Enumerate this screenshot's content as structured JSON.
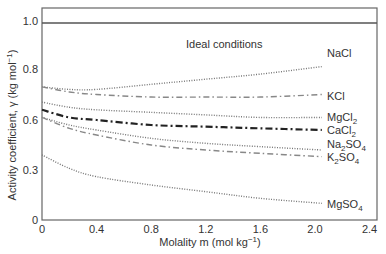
{
  "chart_data": {
    "type": "line",
    "title": "",
    "xlabel": "Molality m (mol kg⁻¹)",
    "ylabel": "Activity coefficient, γ (kg mol⁻¹)",
    "xlim": [
      0,
      2.5
    ],
    "ylim": [
      0,
      1.05
    ],
    "grid": false,
    "legend_position": "inline-right",
    "x_ticks": [
      {
        "value": 0,
        "label": "0"
      },
      {
        "value": 0.4,
        "label": "0.4"
      },
      {
        "value": 0.8,
        "label": "0.8"
      },
      {
        "value": 1.2,
        "label": "1.2"
      },
      {
        "value": 1.6,
        "label": "1.6"
      },
      {
        "value": 2.0,
        "label": "2.0"
      },
      {
        "value": 2.4,
        "label": "2.4"
      }
    ],
    "y_ticks": [
      {
        "value": 0,
        "label": "0"
      },
      {
        "value": 0.3,
        "label": "0.3"
      },
      {
        "value": 0.6,
        "label": "0.6"
      },
      {
        "value": 0.8,
        "label": "0.8"
      },
      {
        "value": 1.0,
        "label": "1.0"
      }
    ],
    "annotations": [
      {
        "text": "Ideal conditions",
        "x": 1.2,
        "y": 0.94
      }
    ],
    "x": [
      0,
      0.2,
      0.4,
      0.8,
      1.2,
      1.6,
      2.05
    ],
    "series": [
      {
        "name": "Ideal",
        "label": "",
        "style": "solid",
        "color": "#555555",
        "x": [
          0,
          2.5
        ],
        "values": [
          0.99,
          0.99
        ]
      },
      {
        "name": "NaCl",
        "label": "NaCl",
        "style": "dotted",
        "color": "#777777",
        "values": [
          0.73,
          0.72,
          0.72,
          0.74,
          0.76,
          0.78,
          0.81
        ]
      },
      {
        "name": "KCl",
        "label": "KCl",
        "style": "dashdot",
        "color": "#888888",
        "values": [
          0.73,
          0.71,
          0.7,
          0.69,
          0.69,
          0.69,
          0.7
        ]
      },
      {
        "name": "MgCl2",
        "label": "MgCl₂",
        "style": "dotted",
        "color": "#777777",
        "values": [
          0.67,
          0.65,
          0.64,
          0.63,
          0.62,
          0.61,
          0.61
        ]
      },
      {
        "name": "CaCl2",
        "label": "CaCl₂",
        "style": "dashdot-bold",
        "color": "#222222",
        "values": [
          0.64,
          0.61,
          0.6,
          0.57,
          0.56,
          0.55,
          0.54
        ]
      },
      {
        "name": "Na2SO4",
        "label": "Na₂SO₄",
        "style": "dotted",
        "color": "#777777",
        "values": [
          0.61,
          0.57,
          0.54,
          0.49,
          0.46,
          0.44,
          0.42
        ]
      },
      {
        "name": "K2SO4",
        "label": "K₂SO₄",
        "style": "dashdot",
        "color": "#888888",
        "values": [
          0.61,
          0.55,
          0.51,
          0.45,
          0.42,
          0.4,
          0.38
        ]
      },
      {
        "name": "MgSO4",
        "label": "MgSO₄",
        "style": "dotted",
        "color": "#777777",
        "values": [
          0.39,
          0.31,
          0.26,
          0.21,
          0.17,
          0.13,
          0.1
        ]
      }
    ]
  },
  "labels": {
    "ideal": "Ideal conditions",
    "xlabel": "Molality m (mol kg",
    "xlabel_sup": "−1",
    "xlabel_end": ")",
    "ylabel": "Activity coefficient, γ (kg mol",
    "ylabel_sup": "−1",
    "ylabel_end": ")",
    "nacl": "NaCl",
    "kcl": "KCl",
    "mgcl_a": "MgCl",
    "mgcl_sub": "2",
    "cacl_a": "CaCl",
    "cacl_sub": "2",
    "na2so4_a": "Na",
    "na2so4_sub1": "2",
    "na2so4_b": "SO",
    "na2so4_sub2": "4",
    "k2so4_a": "K",
    "k2so4_sub1": "2",
    "k2so4_b": "SO",
    "k2so4_sub2": "4",
    "mgso4_a": "MgSO",
    "mgso4_sub": "4"
  }
}
